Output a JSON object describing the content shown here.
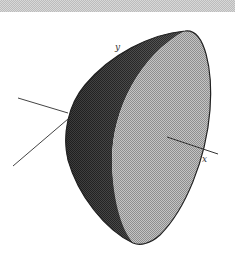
{
  "figure": {
    "axes": [
      {
        "name": "y",
        "label": "y"
      },
      {
        "name": "x",
        "label": "x"
      }
    ],
    "colors": {
      "dark_surface": "#4a4a4a",
      "light_face": "#b0b0b0",
      "outline": "#222222",
      "axis_line": "#444444",
      "banner": "#cfcfcf"
    }
  }
}
